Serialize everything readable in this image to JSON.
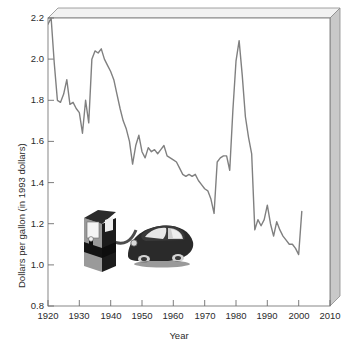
{
  "chart_data": {
    "type": "line",
    "title": "",
    "xlabel": "Year",
    "ylabel": "Dollars per gallon (in 1993 dollars)",
    "xlim": [
      1920,
      2010
    ],
    "ylim": [
      0.8,
      2.2
    ],
    "xticks": [
      1920,
      1930,
      1940,
      1950,
      1960,
      1970,
      1980,
      1990,
      2000,
      2010
    ],
    "yticks": [
      0.8,
      1.0,
      1.2,
      1.4,
      1.6,
      1.8,
      2.0,
      2.2
    ],
    "xtick_labels": [
      "1920",
      "1930",
      "1940",
      "1950",
      "1960",
      "1970",
      "1980",
      "1990",
      "2000",
      "2010"
    ],
    "ytick_labels": [
      "0.8",
      "1.0",
      "1.2",
      "1.4",
      "1.6",
      "1.8",
      "2.0",
      "2.2"
    ],
    "grid": false,
    "legend": false,
    "line_color": "#808080",
    "series": [
      {
        "name": "Gasoline price (1993 dollars)",
        "x": [
          1920,
          1921,
          1922,
          1923,
          1924,
          1925,
          1926,
          1927,
          1928,
          1929,
          1930,
          1931,
          1932,
          1933,
          1934,
          1935,
          1936,
          1937,
          1938,
          1939,
          1940,
          1941,
          1942,
          1943,
          1944,
          1945,
          1946,
          1947,
          1948,
          1949,
          1950,
          1951,
          1952,
          1953,
          1954,
          1955,
          1956,
          1957,
          1958,
          1959,
          1960,
          1961,
          1962,
          1963,
          1964,
          1965,
          1966,
          1967,
          1968,
          1969,
          1970,
          1971,
          1972,
          1973,
          1974,
          1975,
          1976,
          1977,
          1978,
          1979,
          1980,
          1981,
          1982,
          1983,
          1984,
          1985,
          1986,
          1987,
          1988,
          1989,
          1990,
          1991,
          1992,
          1993,
          1994,
          1995,
          1996,
          1997,
          1998,
          1999,
          2000,
          2001
        ],
        "values": [
          2.17,
          2.2,
          1.98,
          1.8,
          1.79,
          1.83,
          1.9,
          1.78,
          1.79,
          1.76,
          1.74,
          1.64,
          1.8,
          1.69,
          2.0,
          2.04,
          2.03,
          2.05,
          2.0,
          1.97,
          1.94,
          1.9,
          1.83,
          1.76,
          1.7,
          1.66,
          1.6,
          1.49,
          1.58,
          1.63,
          1.55,
          1.52,
          1.57,
          1.55,
          1.56,
          1.54,
          1.56,
          1.58,
          1.53,
          1.52,
          1.51,
          1.5,
          1.47,
          1.44,
          1.43,
          1.44,
          1.43,
          1.44,
          1.41,
          1.39,
          1.37,
          1.36,
          1.32,
          1.25,
          1.5,
          1.52,
          1.53,
          1.53,
          1.46,
          1.75,
          1.99,
          2.09,
          1.92,
          1.72,
          1.62,
          1.54,
          1.17,
          1.22,
          1.19,
          1.22,
          1.29,
          1.2,
          1.14,
          1.21,
          1.17,
          1.14,
          1.12,
          1.1,
          1.1,
          1.08,
          1.05,
          1.26
        ]
      }
    ],
    "annotations": [
      {
        "name": "gas-pump-and-car-clipart",
        "description": "Illustration of a fuel pump connected by a hose to a dark sedan"
      }
    ]
  },
  "decor": {
    "pump_label": "gas-pump-illustration",
    "car_label": "car-illustration"
  }
}
